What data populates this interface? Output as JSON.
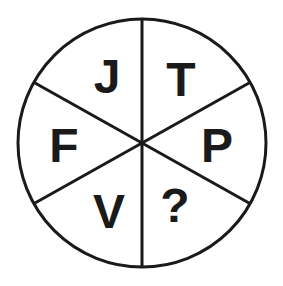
{
  "puzzle": {
    "description": "Circle divided into six sectors containing letters; one sector is unknown",
    "sectors": [
      {
        "position": "top-left",
        "label": "J"
      },
      {
        "position": "top-right",
        "label": "T"
      },
      {
        "position": "right",
        "label": "P"
      },
      {
        "position": "bottom-right",
        "label": "?"
      },
      {
        "position": "bottom-left",
        "label": "V"
      },
      {
        "position": "left",
        "label": "F"
      }
    ]
  },
  "colors": {
    "stroke": "#1a1a1a",
    "background": "#ffffff"
  }
}
